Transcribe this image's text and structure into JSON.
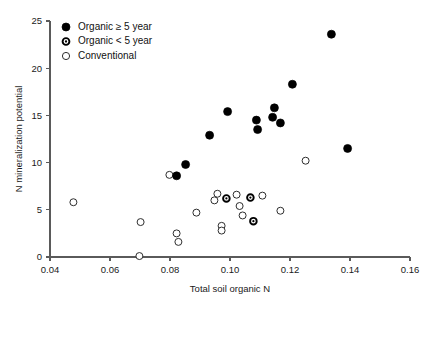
{
  "chart_data": {
    "type": "scatter",
    "title": "",
    "xlabel": "Total soil organic N",
    "ylabel": "N mineralization potential",
    "xlim": [
      0.04,
      0.16
    ],
    "ylim": [
      0,
      25
    ],
    "xticks": [
      "0.04",
      "0.06",
      "0.08",
      "0.10",
      "0.12",
      "0.14",
      "0.16"
    ],
    "xtick_values": [
      0.04,
      0.06,
      0.08,
      0.1,
      0.12,
      0.14,
      0.16
    ],
    "yticks": [
      "0",
      "5",
      "10",
      "15",
      "20",
      "25"
    ],
    "ytick_values": [
      0,
      5,
      10,
      15,
      20,
      25
    ],
    "grid": false,
    "legend_position": "top-left",
    "series": [
      {
        "name": "Organic ≥ 5 year",
        "marker": "filled-circle",
        "color": "#000000",
        "points": [
          {
            "x": 0.0822,
            "y": 8.6
          },
          {
            "x": 0.0852,
            "y": 9.8
          },
          {
            "x": 0.0932,
            "y": 12.9
          },
          {
            "x": 0.0992,
            "y": 15.4
          },
          {
            "x": 0.1088,
            "y": 14.5
          },
          {
            "x": 0.1092,
            "y": 13.5
          },
          {
            "x": 0.1148,
            "y": 15.8
          },
          {
            "x": 0.1142,
            "y": 14.8
          },
          {
            "x": 0.1168,
            "y": 14.2
          },
          {
            "x": 0.1208,
            "y": 18.3
          },
          {
            "x": 0.1338,
            "y": 23.6
          },
          {
            "x": 0.1392,
            "y": 11.5
          }
        ]
      },
      {
        "name": "Organic < 5 year",
        "marker": "dot-in-circle",
        "color": "#000000",
        "points": [
          {
            "x": 0.0988,
            "y": 6.2
          },
          {
            "x": 0.1068,
            "y": 6.3
          },
          {
            "x": 0.1078,
            "y": 3.8
          }
        ]
      },
      {
        "name": "Conventional",
        "marker": "open-circle",
        "color": "#ffffff",
        "points": [
          {
            "x": 0.0478,
            "y": 5.8
          },
          {
            "x": 0.0698,
            "y": 0.1
          },
          {
            "x": 0.0702,
            "y": 3.7
          },
          {
            "x": 0.0798,
            "y": 8.7
          },
          {
            "x": 0.0822,
            "y": 2.5
          },
          {
            "x": 0.0828,
            "y": 1.6
          },
          {
            "x": 0.0888,
            "y": 4.7
          },
          {
            "x": 0.0948,
            "y": 6.0
          },
          {
            "x": 0.0958,
            "y": 6.7
          },
          {
            "x": 0.0972,
            "y": 3.3
          },
          {
            "x": 0.0972,
            "y": 2.8
          },
          {
            "x": 0.1022,
            "y": 6.6
          },
          {
            "x": 0.1032,
            "y": 5.4
          },
          {
            "x": 0.1042,
            "y": 4.4
          },
          {
            "x": 0.1108,
            "y": 6.5
          },
          {
            "x": 0.1168,
            "y": 4.9
          },
          {
            "x": 0.1252,
            "y": 10.2
          }
        ]
      }
    ]
  },
  "legend": {
    "entries": [
      {
        "label": "Organic ≥ 5 year",
        "marker": "filled-circle"
      },
      {
        "label": "Organic < 5 year",
        "marker": "dot-in-circle"
      },
      {
        "label": "Conventional",
        "marker": "open-circle"
      }
    ]
  },
  "colors": {
    "marker": "#000000",
    "axis": "#5a5a5a",
    "text": "#1a1a1a",
    "background": "#ffffff"
  }
}
